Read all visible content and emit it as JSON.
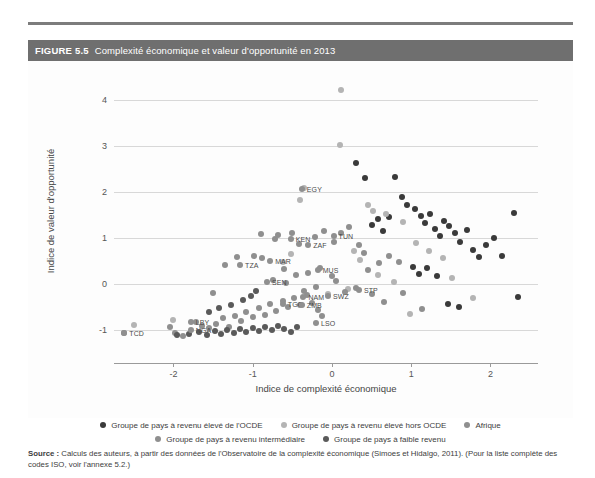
{
  "figure": {
    "number": "FIGURE 5.5",
    "title": "Complexité économique et valeur d'opportunité en 2013",
    "source_label": "Source :",
    "source_text": " Calculs des auteurs, à partir des données de l'Observatoire de la complexité économique (Simoes et Hidalgo, 2011). (Pour la liste complète des codes ISO, voir l'annexe 5.2.)"
  },
  "chart_data": {
    "type": "scatter",
    "title": "Complexité économique et valeur d'opportunité en 2013",
    "xlabel": "Indice de complexité économique",
    "ylabel": "Indice de valeur d'opportunité",
    "xlim": [
      -2.75,
      2.6
    ],
    "ylim": [
      -1.45,
      4.45
    ],
    "xticks": [
      -2,
      -1,
      0,
      1,
      2
    ],
    "yticks": [
      -1,
      0,
      1,
      2,
      3,
      4
    ],
    "grid": "horizontal",
    "legend_position": "bottom",
    "colors": {
      "oecd_high": "#3a3a3a",
      "non_oecd_high": "#b4b4b4",
      "africa": "#8f8f8f",
      "middle_income": "#8f8f8f",
      "low_income": "#5a5a5a"
    },
    "series": [
      {
        "name": "Groupe de pays à revenu élevé de l'OCDE",
        "key": "oecd_high",
        "color": "#3a3a3a",
        "points": [
          {
            "x": 1.05,
            "y": 1.62
          },
          {
            "x": 1.12,
            "y": 1.48
          },
          {
            "x": 1.18,
            "y": 1.33
          },
          {
            "x": 1.24,
            "y": 1.52
          },
          {
            "x": 1.3,
            "y": 1.2
          },
          {
            "x": 1.36,
            "y": 1.04
          },
          {
            "x": 1.42,
            "y": 1.38
          },
          {
            "x": 1.48,
            "y": 1.26
          },
          {
            "x": 1.55,
            "y": 1.1
          },
          {
            "x": 1.62,
            "y": 0.92
          },
          {
            "x": 1.7,
            "y": 1.18
          },
          {
            "x": 1.78,
            "y": 0.75
          },
          {
            "x": 1.86,
            "y": 0.58
          },
          {
            "x": 1.95,
            "y": 0.86
          },
          {
            "x": 2.05,
            "y": 1.0
          },
          {
            "x": 2.14,
            "y": 0.62
          },
          {
            "x": 2.3,
            "y": 1.55
          },
          {
            "x": 2.35,
            "y": -0.28
          },
          {
            "x": 0.95,
            "y": 1.72
          },
          {
            "x": 0.88,
            "y": 1.9
          },
          {
            "x": 0.8,
            "y": 2.32
          },
          {
            "x": 0.72,
            "y": 1.46
          },
          {
            "x": 0.64,
            "y": 1.16
          },
          {
            "x": 0.58,
            "y": 1.42
          },
          {
            "x": 0.5,
            "y": 1.28
          },
          {
            "x": 0.42,
            "y": 2.3
          },
          {
            "x": 1.02,
            "y": 0.38
          },
          {
            "x": 1.1,
            "y": 0.22
          },
          {
            "x": 1.2,
            "y": 0.34
          },
          {
            "x": 1.32,
            "y": 0.18
          },
          {
            "x": 1.46,
            "y": -0.42
          },
          {
            "x": 1.6,
            "y": -0.5
          },
          {
            "x": 0.3,
            "y": 2.62
          }
        ]
      },
      {
        "name": "Groupe de pays à revenu élevé hors OCDE",
        "key": "non_oecd_high",
        "color": "#b4b4b4",
        "points": [
          {
            "x": 0.12,
            "y": 4.22
          },
          {
            "x": 0.1,
            "y": 3.02
          },
          {
            "x": -0.35,
            "y": 2.08
          },
          {
            "x": -0.4,
            "y": 1.82
          },
          {
            "x": 0.45,
            "y": 1.72
          },
          {
            "x": 0.52,
            "y": 1.58
          },
          {
            "x": 0.68,
            "y": 1.52
          },
          {
            "x": 0.9,
            "y": 1.34
          },
          {
            "x": 1.06,
            "y": 0.9
          },
          {
            "x": 0.28,
            "y": 0.72
          },
          {
            "x": 0.35,
            "y": 0.52
          },
          {
            "x": -0.52,
            "y": 0.66
          },
          {
            "x": -0.62,
            "y": 0.48
          },
          {
            "x": 0.58,
            "y": 0.2
          },
          {
            "x": 0.78,
            "y": 0.04
          },
          {
            "x": 1.22,
            "y": 0.72
          },
          {
            "x": 1.4,
            "y": 0.56
          },
          {
            "x": 0.2,
            "y": -0.1
          },
          {
            "x": -0.05,
            "y": -0.22
          },
          {
            "x": 0.98,
            "y": -0.64
          },
          {
            "x": 1.52,
            "y": 0.14
          },
          {
            "x": 1.78,
            "y": -0.3
          },
          {
            "x": -2.0,
            "y": -0.78
          },
          {
            "x": -2.5,
            "y": -0.88
          }
        ]
      },
      {
        "name": "Afrique",
        "key": "africa",
        "color": "#8f8f8f",
        "points": [
          {
            "x": -2.62,
            "y": -1.06
          },
          {
            "x": -2.04,
            "y": -0.92
          },
          {
            "x": -1.98,
            "y": -1.06
          },
          {
            "x": -1.88,
            "y": -1.12
          },
          {
            "x": -1.72,
            "y": -0.82
          },
          {
            "x": -1.64,
            "y": -0.9
          },
          {
            "x": -1.55,
            "y": -0.96
          },
          {
            "x": -1.46,
            "y": -0.86
          },
          {
            "x": -1.38,
            "y": -0.74
          },
          {
            "x": -1.3,
            "y": -0.92
          },
          {
            "x": -1.22,
            "y": -0.68
          },
          {
            "x": -1.15,
            "y": -0.8
          },
          {
            "x": -1.08,
            "y": -0.6
          },
          {
            "x": -1.0,
            "y": -0.72
          },
          {
            "x": -0.92,
            "y": -0.52
          },
          {
            "x": -0.85,
            "y": -0.66
          },
          {
            "x": -0.78,
            "y": -0.44
          },
          {
            "x": -0.7,
            "y": -0.58
          },
          {
            "x": -0.62,
            "y": -0.36
          },
          {
            "x": -0.55,
            "y": -0.5
          },
          {
            "x": -0.48,
            "y": -0.3
          },
          {
            "x": -0.4,
            "y": -0.46
          },
          {
            "x": -0.32,
            "y": -0.24
          },
          {
            "x": -0.25,
            "y": -0.4
          },
          {
            "x": -0.18,
            "y": -0.56
          },
          {
            "x": -0.12,
            "y": -0.7
          },
          {
            "x": -1.35,
            "y": 0.42
          },
          {
            "x": -1.2,
            "y": 0.58
          },
          {
            "x": -0.98,
            "y": 0.62
          },
          {
            "x": -0.88,
            "y": 0.56
          },
          {
            "x": -0.75,
            "y": 0.1
          },
          {
            "x": -0.58,
            "y": 0.02
          },
          {
            "x": -0.3,
            "y": 0.24
          },
          {
            "x": -0.2,
            "y": -0.06
          },
          {
            "x": -0.9,
            "y": 1.08
          },
          {
            "x": -0.72,
            "y": 0.98
          },
          {
            "x": 0.05,
            "y": 0.06
          },
          {
            "x": 0.16,
            "y": -0.18
          },
          {
            "x": 0.3,
            "y": -0.08
          }
        ]
      },
      {
        "name": "Groupe de pays à revenu intermédiaire",
        "key": "middle_income",
        "color": "#8f8f8f",
        "points": [
          {
            "x": -0.68,
            "y": 1.06
          },
          {
            "x": -0.5,
            "y": 1.12
          },
          {
            "x": -0.42,
            "y": 0.88
          },
          {
            "x": -0.22,
            "y": 1.02
          },
          {
            "x": -0.1,
            "y": 1.16
          },
          {
            "x": 0.02,
            "y": 0.92
          },
          {
            "x": 0.12,
            "y": 1.1
          },
          {
            "x": 0.22,
            "y": 1.24
          },
          {
            "x": 0.34,
            "y": 0.86
          },
          {
            "x": 0.4,
            "y": 0.68
          },
          {
            "x": -0.6,
            "y": 0.32
          },
          {
            "x": -0.45,
            "y": 0.2
          },
          {
            "x": -0.15,
            "y": 0.34
          },
          {
            "x": 0.0,
            "y": 0.18
          },
          {
            "x": 0.46,
            "y": 0.3
          },
          {
            "x": 0.6,
            "y": 0.46
          },
          {
            "x": 0.72,
            "y": 0.62
          },
          {
            "x": 0.84,
            "y": 0.48
          },
          {
            "x": -0.35,
            "y": -0.14
          },
          {
            "x": 0.5,
            "y": -0.22
          },
          {
            "x": 0.66,
            "y": -0.38
          },
          {
            "x": 0.9,
            "y": -0.2
          },
          {
            "x": 1.14,
            "y": -0.54
          },
          {
            "x": -1.5,
            "y": -0.2
          }
        ]
      },
      {
        "name": "Groupe de pays à faible revenu",
        "key": "low_income",
        "color": "#5a5a5a",
        "points": [
          {
            "x": -1.95,
            "y": -1.1
          },
          {
            "x": -1.8,
            "y": -1.08
          },
          {
            "x": -1.68,
            "y": -1.04
          },
          {
            "x": -1.58,
            "y": -1.1
          },
          {
            "x": -1.48,
            "y": -1.02
          },
          {
            "x": -1.4,
            "y": -1.08
          },
          {
            "x": -1.32,
            "y": -1.0
          },
          {
            "x": -1.24,
            "y": -1.06
          },
          {
            "x": -1.16,
            "y": -0.98
          },
          {
            "x": -1.08,
            "y": -1.04
          },
          {
            "x": -1.0,
            "y": -0.96
          },
          {
            "x": -0.92,
            "y": -1.02
          },
          {
            "x": -0.84,
            "y": -0.94
          },
          {
            "x": -0.76,
            "y": -1.0
          },
          {
            "x": -0.68,
            "y": -0.9
          },
          {
            "x": -0.6,
            "y": -0.98
          },
          {
            "x": -0.52,
            "y": -1.04
          },
          {
            "x": -0.44,
            "y": -0.92
          },
          {
            "x": -1.55,
            "y": -0.6
          },
          {
            "x": -1.42,
            "y": -0.52
          },
          {
            "x": -1.28,
            "y": -0.46
          },
          {
            "x": -1.12,
            "y": -0.34
          },
          {
            "x": -1.02,
            "y": -0.26
          },
          {
            "x": -0.96,
            "y": -0.14
          }
        ]
      }
    ],
    "labeled_points": [
      {
        "code": "TCD",
        "x": -2.62,
        "y": -1.06,
        "series": "africa",
        "anchor": "right"
      },
      {
        "code": "LBY",
        "x": -1.78,
        "y": -0.82,
        "series": "africa",
        "anchor": "right"
      },
      {
        "code": "NGA",
        "x": -1.78,
        "y": -1.0,
        "series": "africa",
        "anchor": "right"
      },
      {
        "code": "TZA",
        "x": -1.16,
        "y": 0.42,
        "series": "africa",
        "anchor": "right"
      },
      {
        "code": "MAR",
        "x": -0.78,
        "y": 0.5,
        "series": "africa",
        "anchor": "right"
      },
      {
        "code": "SEN",
        "x": -0.82,
        "y": 0.04,
        "series": "africa",
        "anchor": "right"
      },
      {
        "code": "KEN",
        "x": -0.52,
        "y": 0.98,
        "series": "africa",
        "anchor": "right"
      },
      {
        "code": "ZAF",
        "x": -0.3,
        "y": 0.86,
        "series": "africa",
        "anchor": "right"
      },
      {
        "code": "EGY",
        "x": -0.38,
        "y": 2.06,
        "series": "africa",
        "anchor": "right"
      },
      {
        "code": "TUN",
        "x": 0.02,
        "y": 1.04,
        "series": "africa",
        "anchor": "right"
      },
      {
        "code": "MUS",
        "x": -0.18,
        "y": 0.3,
        "series": "africa",
        "anchor": "right"
      },
      {
        "code": "NAM",
        "x": -0.36,
        "y": -0.28,
        "series": "africa",
        "anchor": "right"
      },
      {
        "code": "SWZ",
        "x": -0.05,
        "y": -0.26,
        "series": "africa",
        "anchor": "right"
      },
      {
        "code": "TGO",
        "x": -0.62,
        "y": -0.44,
        "series": "africa",
        "anchor": "right"
      },
      {
        "code": "ZMB",
        "x": -0.38,
        "y": -0.46,
        "series": "africa",
        "anchor": "right"
      },
      {
        "code": "STP",
        "x": 0.34,
        "y": -0.12,
        "series": "africa",
        "anchor": "right"
      },
      {
        "code": "LSO",
        "x": -0.2,
        "y": -0.84,
        "series": "africa",
        "anchor": "right"
      }
    ]
  },
  "legend": {
    "rows": [
      [
        {
          "label": "Groupe de pays à revenu élevé de l'OCDE",
          "color": "#3a3a3a"
        },
        {
          "label": "Groupe de pays à revenu élevé hors OCDE",
          "color": "#b4b4b4"
        },
        {
          "label": "Afrique",
          "color": "#8f8f8f"
        }
      ],
      [
        {
          "label": "Groupe de pays à revenu intermédiaire",
          "color": "#8f8f8f"
        },
        {
          "label": "Groupe de pays à faible revenu",
          "color": "#5a5a5a"
        }
      ]
    ]
  }
}
